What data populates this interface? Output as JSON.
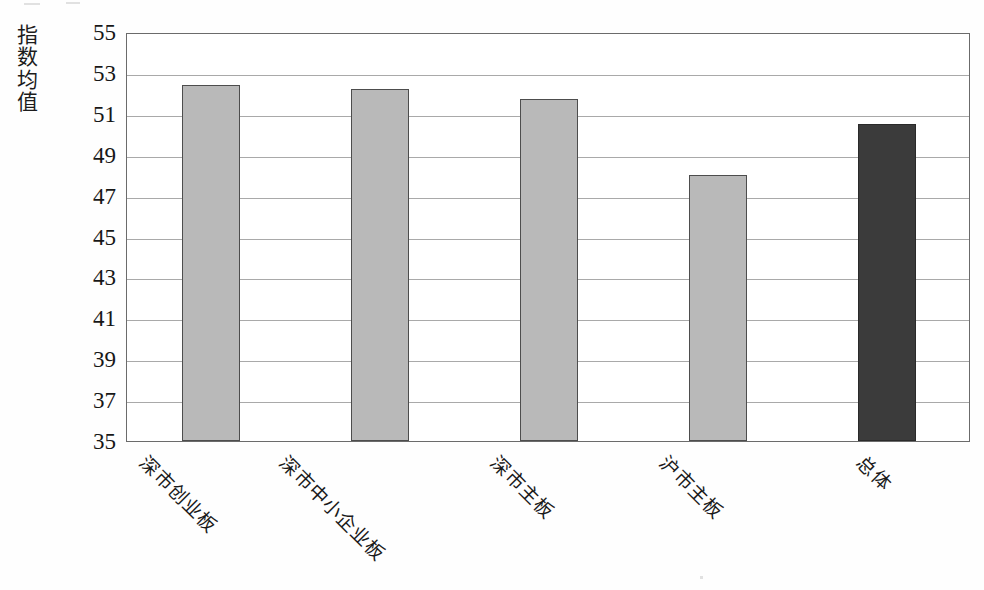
{
  "chart": {
    "y_axis_title_chars": [
      "指",
      "数",
      "均",
      "值"
    ],
    "y_axis_title": "指数均值"
  },
  "chart_data": {
    "type": "bar",
    "title": "",
    "xlabel": "",
    "ylabel": "指数均值",
    "ylim": [
      35,
      55
    ],
    "ytick_step": 2,
    "yticks": [
      55,
      53,
      51,
      49,
      47,
      45,
      43,
      41,
      39,
      37,
      35
    ],
    "grid": true,
    "legend": null,
    "categories": [
      "深市创业板",
      "深市中小企业板",
      "深市主板",
      "沪市主板",
      "总体"
    ],
    "values": [
      52.4,
      52.2,
      51.7,
      48.0,
      50.5
    ],
    "colors": [
      "#b9b9b9",
      "#b9b9b9",
      "#b9b9b9",
      "#b9b9b9",
      "#3b3b3b"
    ],
    "bars": [
      {
        "label": "深市创业板",
        "value": 52.4,
        "color": "#b9b9b9"
      },
      {
        "label": "深市中小企业板",
        "value": 52.2,
        "color": "#b9b9b9"
      },
      {
        "label": "深市主板",
        "value": 51.7,
        "color": "#b9b9b9"
      },
      {
        "label": "沪市主板",
        "value": 48.0,
        "color": "#b9b9b9"
      },
      {
        "label": "总体",
        "value": 50.5,
        "color": "#3b3b3b"
      }
    ]
  }
}
